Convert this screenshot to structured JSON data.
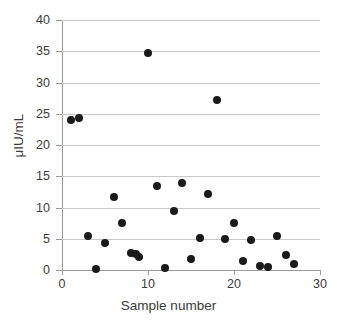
{
  "chart_data": {
    "type": "scatter",
    "title": "",
    "xlabel": "Sample number",
    "ylabel": "μIU/mL",
    "xlim": [
      0,
      30
    ],
    "ylim": [
      0,
      40
    ],
    "xticks": [
      0,
      10,
      20,
      30
    ],
    "yticks": [
      0,
      5,
      10,
      15,
      20,
      25,
      30,
      35,
      40
    ],
    "grid": "horizontal",
    "legend": "none",
    "marker": {
      "shape": "circle",
      "color": "#1a1a1a",
      "size": 8
    },
    "series": [
      {
        "name": "samples",
        "points": [
          {
            "x": 1,
            "y": 24.0
          },
          {
            "x": 2,
            "y": 24.4
          },
          {
            "x": 3,
            "y": 5.4
          },
          {
            "x": 4,
            "y": 0.1
          },
          {
            "x": 5,
            "y": 4.3
          },
          {
            "x": 6,
            "y": 11.7
          },
          {
            "x": 7,
            "y": 7.6
          },
          {
            "x": 8,
            "y": 2.7
          },
          {
            "x": 8.6,
            "y": 2.5
          },
          {
            "x": 9,
            "y": 2.1
          },
          {
            "x": 10,
            "y": 34.8
          },
          {
            "x": 11,
            "y": 13.5
          },
          {
            "x": 12,
            "y": 0.4
          },
          {
            "x": 13,
            "y": 9.5
          },
          {
            "x": 14,
            "y": 14.0
          },
          {
            "x": 15,
            "y": 1.7
          },
          {
            "x": 16,
            "y": 5.1
          },
          {
            "x": 17,
            "y": 12.2
          },
          {
            "x": 18,
            "y": 27.2
          },
          {
            "x": 19,
            "y": 4.9
          },
          {
            "x": 20,
            "y": 7.5
          },
          {
            "x": 21,
            "y": 1.4
          },
          {
            "x": 22,
            "y": 4.8
          },
          {
            "x": 23,
            "y": 0.6
          },
          {
            "x": 24,
            "y": 0.5
          },
          {
            "x": 25,
            "y": 5.4
          },
          {
            "x": 26,
            "y": 2.4
          },
          {
            "x": 27,
            "y": 1.0
          }
        ]
      }
    ]
  },
  "colors": {
    "marker": "#1a1a1a",
    "gridline": "#c8c8c8",
    "axis": "#9a9a9a",
    "text": "#3a3a3a",
    "background": "#ffffff"
  }
}
